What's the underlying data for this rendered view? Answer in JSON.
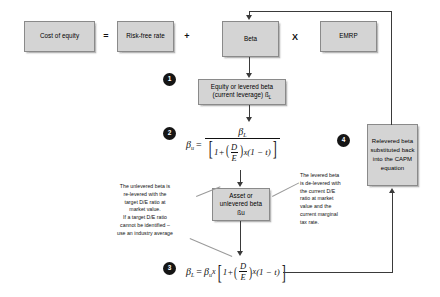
{
  "diagram": {
    "colors": {
      "box_fill": "#d4d4d4",
      "box_border": "#8a8a8a",
      "badge_fill": "#151515",
      "line": "#3a3a3a",
      "background": "#ffffff"
    },
    "equation_row": {
      "cost_of_equity": "Cost of equity",
      "equals": "=",
      "risk_free_rate": "Risk-free rate",
      "plus": "+",
      "beta": "Beta",
      "times": "X",
      "emrp": "EMRP"
    },
    "nodes": {
      "levered_beta": {
        "line1": "Equity or levered beta",
        "line2": "(current leverage) ß",
        "line2_sub": "L"
      },
      "unlevered_beta": {
        "line1": "Asset or",
        "line2": "unlevered beta",
        "line3": "ßu"
      },
      "relevered_beta": "Relevered beta substituted back into the CAPM equation"
    },
    "badges": [
      {
        "number": "1"
      },
      {
        "number": "2"
      },
      {
        "number": "3"
      },
      {
        "number": "4"
      }
    ],
    "formulas": {
      "unlever": {
        "lhs_symbol": "β",
        "lhs_sub": "u",
        "equals": "=",
        "numerator_symbol": "β",
        "numerator_sub": "L",
        "denominator_text": "1 + (D/E) x (1 − t)",
        "den_one_plus": "1+",
        "den_d": "D",
        "den_e": "E",
        "den_x": "x",
        "den_tail": "(1 − t)",
        "plain": "βu = βL / [1 + (D/E) x (1 − t)]"
      },
      "relever": {
        "lhs_symbol": "β",
        "lhs_sub": "L",
        "equals": "=",
        "rhs_symbol": "β",
        "rhs_sub": "u",
        "multiply": "x",
        "one_plus": "1+",
        "d": "D",
        "e": "E",
        "x": "x",
        "tail": "(1 − t)",
        "plain": "βL = βu x [1 + (D/E) x (1 − t)]"
      }
    },
    "annotations": {
      "left": [
        "The unlevered beta is",
        "re-levered with the",
        "target D/E ratio at",
        "market value.",
        "If a target D/E ratio",
        "cannot be identified –",
        "use an industry average"
      ],
      "right": [
        "The levered beta",
        "is de-levered with",
        "the current D/E",
        "ratio at market",
        "value and the",
        "current marginal",
        "tax rate."
      ]
    }
  }
}
